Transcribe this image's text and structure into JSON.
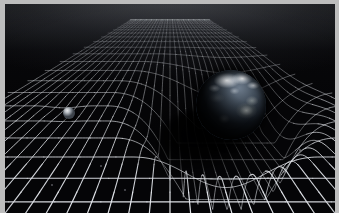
{
  "image": {
    "title": "Spacetime curvature caused by Earth's mass",
    "subject": "gravity-well",
    "width": 339,
    "height": 213,
    "border_color": "#bdbdbd",
    "background_color": "#050507",
    "grid_color": "#e6e9ee",
    "grid_color_dim": "#9aa0aa"
  },
  "scene": {
    "grid": {
      "label": "spacetime fabric grid",
      "rows": 30,
      "cols": 34,
      "horizon_y": 4,
      "line_color": "#e6e9ee"
    },
    "well": {
      "label": "gravity well depression",
      "center_x": 226,
      "center_y": 112,
      "radius": 120,
      "depth": 86
    },
    "earth": {
      "label": "Earth",
      "center_x": 226,
      "center_y": 101,
      "radius": 35,
      "ocean_color": "#46525f",
      "cloud_color": "#f6f8fa",
      "shadow_color": "#000000"
    },
    "small_sphere": {
      "label": "orbiting sphere",
      "center_x": 64,
      "center_y": 109,
      "radius": 6,
      "color": "#b9bec4"
    },
    "shadow_pool": {
      "label": "umbral shadow on grid",
      "center_x": 196,
      "center_y": 135
    },
    "specks": [
      {
        "x": 101,
        "y": 166,
        "r": 1.2
      },
      {
        "x": 125,
        "y": 190,
        "r": 1.1
      },
      {
        "x": 52,
        "y": 185,
        "r": 1.0
      },
      {
        "x": 268,
        "y": 178,
        "r": 1.1
      },
      {
        "x": 300,
        "y": 150,
        "r": 0.9
      }
    ]
  },
  "chart_data": {
    "type": "surface",
    "xlabel": "",
    "ylabel": "",
    "grid": true,
    "legend": "none",
    "masses": [
      {
        "name": "Earth",
        "relative_mass": 1.0,
        "well_depth": 86,
        "position": [
          226,
          101
        ]
      },
      {
        "name": "Small sphere",
        "relative_mass": 0.01,
        "well_depth": 3,
        "position": [
          64,
          109
        ]
      }
    ]
  }
}
